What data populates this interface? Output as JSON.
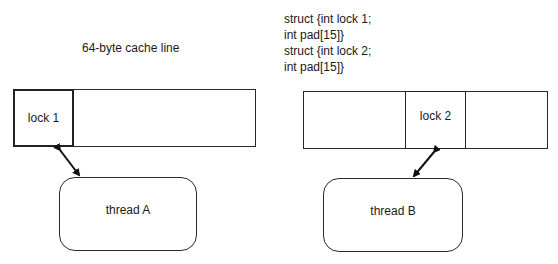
{
  "left": {
    "caption": "64-byte cache line",
    "lock_label": "lock 1",
    "thread_label": "thread A"
  },
  "right": {
    "code_lines": [
      "struct {int lock 1;",
      "int pad[15]}",
      "struct {int lock 2;",
      "int pad[15]}"
    ],
    "lock_label": "lock 2",
    "thread_label": "thread B"
  }
}
